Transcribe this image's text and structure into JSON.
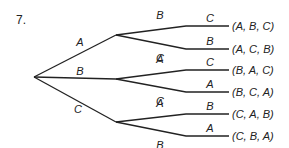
{
  "problem_number": "7.",
  "tree": {
    "first": [
      {
        "label": "A",
        "second": [
          {
            "label": "B",
            "third": "C",
            "result": "(A,B,C)"
          },
          {
            "label": "C",
            "third": "B",
            "result": "(A,C,B)"
          }
        ]
      },
      {
        "label": "B",
        "second": [
          {
            "label": "A",
            "third": "C",
            "result": "(B,A,C)"
          },
          {
            "label": "C",
            "third": "A",
            "result": "(B,C,A)"
          }
        ]
      },
      {
        "label": "C",
        "second": [
          {
            "label": "A",
            "third": "B",
            "result": "(C,A,B)"
          },
          {
            "label": "B",
            "third": "A",
            "result": "(C,B,A)"
          }
        ]
      }
    ]
  }
}
